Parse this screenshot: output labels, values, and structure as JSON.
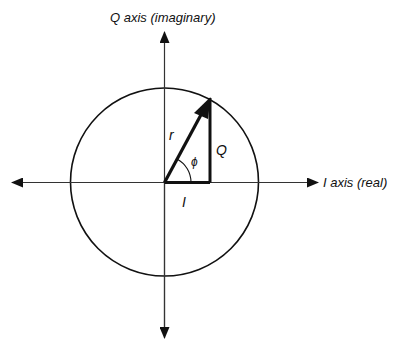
{
  "diagram": {
    "q_axis_label": "Q axis (imaginary)",
    "i_axis_label": "I axis (real)",
    "vector_label": "r",
    "angle_label": "ϕ",
    "q_component_label": "Q",
    "i_component_label": "I",
    "colors": {
      "stroke": "#111111",
      "axis": "#333333",
      "background": "#ffffff"
    }
  }
}
